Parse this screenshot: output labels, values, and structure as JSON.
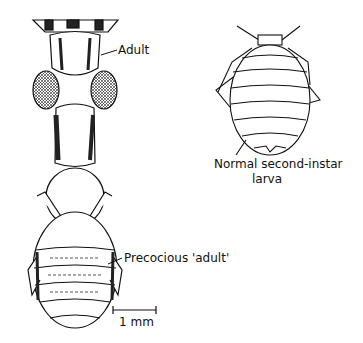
{
  "figure": {
    "labels": {
      "adult": "Adult",
      "precocious_adult": "Precocious 'adult'",
      "normal_larva_line1": "Normal second-instar",
      "normal_larva_line2": "larva"
    },
    "scale_bar": {
      "label": "1 mm"
    },
    "colors": {
      "ink": "#111111",
      "background": "#ffffff"
    }
  }
}
